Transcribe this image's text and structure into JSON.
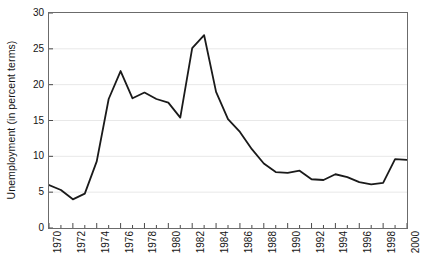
{
  "chart_data": {
    "type": "line",
    "title": "",
    "subtitle": "",
    "xlabel": "",
    "ylabel": "Unemployment (in percent terms)",
    "xlim": [
      1970,
      2000
    ],
    "ylim": [
      0,
      30
    ],
    "ytick_step": 5,
    "yticks": [
      "0",
      "5",
      "10",
      "15",
      "20",
      "25",
      "30"
    ],
    "xticks": [
      "1970",
      "1972",
      "1974",
      "1976",
      "1978",
      "1980",
      "1982",
      "1984",
      "1986",
      "1988",
      "1990",
      "1992",
      "1994",
      "1996",
      "1998",
      "2000"
    ],
    "xtick_step": 2,
    "x_minor_tick_step": 1,
    "grid": "horizontal",
    "grid_color": "#e8e8e8",
    "legend": "none",
    "line_color": "#1a1a1a",
    "line_width": 1.8,
    "border_color": "#6b6b6b",
    "x": [
      1970,
      1971,
      1972,
      1973,
      1974,
      1975,
      1976,
      1977,
      1978,
      1979,
      1980,
      1981,
      1982,
      1983,
      1984,
      1985,
      1986,
      1987,
      1988,
      1989,
      1990,
      1991,
      1992,
      1993,
      1994,
      1995,
      1996,
      1997,
      1998,
      1999,
      2000
    ],
    "values": [
      6.0,
      5.3,
      4.0,
      4.8,
      9.3,
      18.0,
      21.9,
      18.1,
      18.9,
      18.0,
      17.5,
      15.4,
      25.1,
      26.9,
      19.0,
      15.2,
      13.4,
      11.0,
      9.0,
      7.8,
      7.7,
      8.0,
      6.8,
      6.7,
      7.5,
      7.1,
      6.4,
      6.1,
      6.3,
      9.6,
      9.5
    ],
    "series": [
      {
        "name": "Unemployment",
        "values": [
          6.0,
          5.3,
          4.0,
          4.8,
          9.3,
          18.0,
          21.9,
          18.1,
          18.9,
          18.0,
          17.5,
          15.4,
          25.1,
          26.9,
          19.0,
          15.2,
          13.4,
          11.0,
          9.0,
          7.8,
          7.7,
          8.0,
          6.8,
          6.7,
          7.5,
          7.1,
          6.4,
          6.1,
          6.3,
          9.6,
          9.5
        ]
      }
    ],
    "annotations": []
  }
}
